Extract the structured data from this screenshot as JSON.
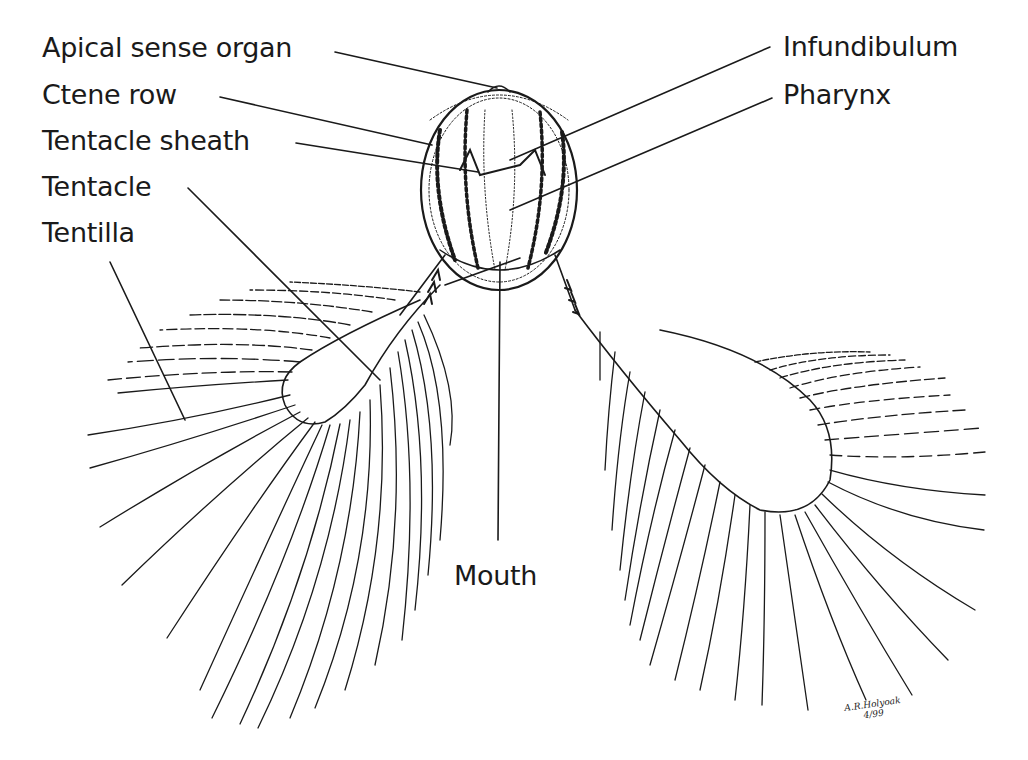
{
  "diagram": {
    "labels": {
      "apical_sense_organ": "Apical sense organ",
      "ctene_row": "Ctene row",
      "tentacle_sheath": "Tentacle sheath",
      "tentacle": "Tentacle",
      "tentilla": "Tentilla",
      "infundibulum": "Infundibulum",
      "pharynx": "Pharynx",
      "mouth": "Mouth"
    },
    "signature": {
      "name": "A.R.Holyoak",
      "date": "4/99"
    },
    "colors": {
      "ink": "#1a1a1a",
      "background": "#ffffff"
    }
  }
}
